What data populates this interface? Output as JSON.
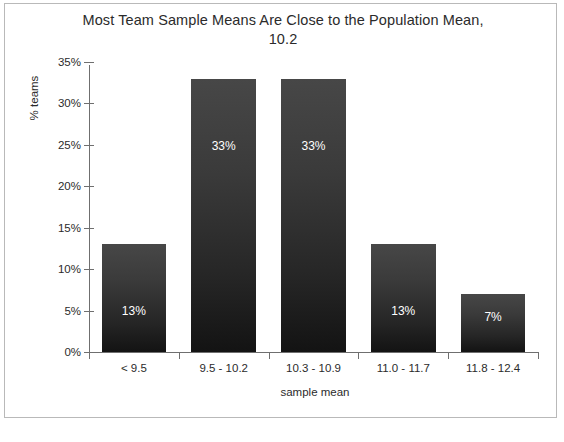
{
  "chart_data": {
    "type": "bar",
    "title": "Most Team Sample Means Are Close to the Population Mean, 10.2",
    "title_line1": "Most Team Sample Means Are Close to the Population Mean,",
    "title_line2": "10.2",
    "xlabel": "sample mean",
    "ylabel": "% teams",
    "categories": [
      "< 9.5",
      "9.5 - 10.2",
      "10.3 - 10.9",
      "11.0 - 11.7",
      "11.8 - 12.4"
    ],
    "values": [
      13,
      33,
      33,
      13,
      7
    ],
    "data_labels": [
      "13%",
      "33%",
      "33%",
      "13%",
      "7%"
    ],
    "ylim": [
      0,
      35
    ],
    "ytick_labels": [
      "0%",
      "5%",
      "10%",
      "15%",
      "20%",
      "25%",
      "30%",
      "35%"
    ],
    "ytick_values": [
      0,
      5,
      10,
      15,
      20,
      25,
      30,
      35
    ],
    "grid": false,
    "legend": "none",
    "bar_color": "#3a3a3a",
    "bar_color_bottom": "#131313",
    "axis_color": "#6f6f6f",
    "text_color": "#2b2b2b",
    "data_label_color": "#ffffff",
    "background": "#ffffff",
    "border_color": "#b9b9b9"
  },
  "caption": {
    "text": ""
  }
}
